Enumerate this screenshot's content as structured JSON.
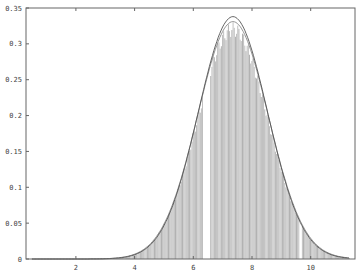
{
  "chart_data": {
    "type": "bar",
    "title": "",
    "xlabel": "",
    "ylabel": "",
    "xlim": [
      0.3,
      11.5
    ],
    "ylim": [
      0,
      0.35
    ],
    "grid": false,
    "legend": null,
    "x_ticks": [
      2,
      4,
      6,
      8,
      10
    ],
    "x_tick_labels": [
      "2",
      "4",
      "6",
      "8",
      "10"
    ],
    "y_ticks": [
      0,
      0.05,
      0.1,
      0.15,
      0.2,
      0.25,
      0.3,
      0.35
    ],
    "y_tick_labels": [
      "0",
      "0.05",
      "0.1",
      "0.15",
      "0.2",
      "0.25",
      "0.3",
      "0.35"
    ],
    "series": [
      {
        "name": "histogram",
        "type": "bar",
        "color": "#b8b8b8",
        "bin_width": 0.04,
        "range": [
          1.5,
          11.3
        ],
        "gaps": [
          [
            6.33,
            6.55
          ],
          [
            9.6,
            9.66
          ]
        ],
        "shape": "normal",
        "mean": 7.35,
        "std": 1.2,
        "peak": 0.33
      },
      {
        "name": "fitted-pdf-outer",
        "type": "line",
        "color": "#555555",
        "shape": "normal",
        "mean": 7.35,
        "std": 1.18,
        "peak": 0.338
      },
      {
        "name": "fitted-pdf-inner",
        "type": "line",
        "color": "#888888",
        "shape": "normal",
        "mean": 7.35,
        "std": 1.2,
        "peak": 0.331
      }
    ]
  }
}
